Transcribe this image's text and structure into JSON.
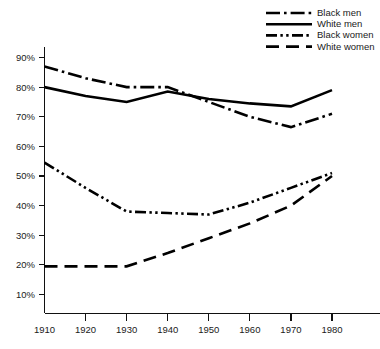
{
  "chart_data": {
    "type": "line",
    "title": "",
    "subtitle": "",
    "xlabel": "",
    "ylabel": "",
    "x": [
      1910,
      1920,
      1930,
      1940,
      1950,
      1960,
      1970,
      1980
    ],
    "xtick_labels": [
      "1910",
      "1920",
      "1930",
      "1940",
      "1950",
      "1960",
      "1970",
      "1980"
    ],
    "ytick_labels": [
      "10%",
      "20%",
      "30%",
      "40%",
      "50%",
      "60%",
      "70%",
      "80%",
      "90%"
    ],
    "ytick_values": [
      10,
      20,
      30,
      40,
      50,
      60,
      70,
      80,
      90
    ],
    "xlim": [
      1910,
      1980
    ],
    "ylim": [
      10,
      90
    ],
    "grid": false,
    "legend_position": "top-right",
    "series": [
      {
        "name": "Black men",
        "dash": "dash-dot",
        "color": "#000000",
        "values": [
          87,
          83,
          80,
          80,
          75,
          70,
          66.5,
          71
        ]
      },
      {
        "name": "White men",
        "dash": "solid",
        "color": "#000000",
        "values": [
          80,
          77,
          75,
          78.5,
          76,
          74.5,
          73.5,
          79
        ]
      },
      {
        "name": "Black women",
        "dash": "dash-dot-dot",
        "color": "#000000",
        "values": [
          54.5,
          46,
          38,
          37.5,
          37,
          41,
          46,
          51
        ]
      },
      {
        "name": "White women",
        "dash": "long-dash",
        "color": "#000000",
        "values": [
          19.5,
          19.5,
          19.5,
          24,
          29,
          34,
          40,
          50
        ]
      }
    ]
  },
  "legend": {
    "items": [
      {
        "label": "Black men"
      },
      {
        "label": "White men"
      },
      {
        "label": "Black women"
      },
      {
        "label": "White women"
      }
    ]
  }
}
